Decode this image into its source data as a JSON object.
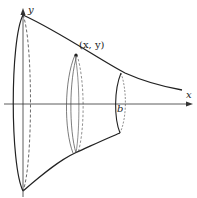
{
  "diagram": {
    "type": "solid-of-revolution",
    "labels": {
      "x_axis": "x",
      "y_axis": "y",
      "point": "(x, y)",
      "b": "b"
    },
    "colors": {
      "stroke": "#222222",
      "background": "#ffffff"
    }
  }
}
